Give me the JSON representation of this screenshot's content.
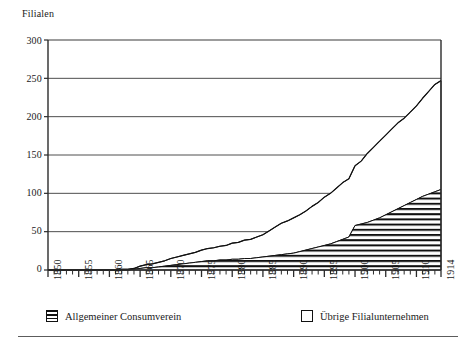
{
  "chart_data": {
    "type": "area",
    "title": "",
    "ylabel": "Filialen",
    "xlabel": "",
    "ylim": [
      0,
      300
    ],
    "xlim": [
      1850,
      1914
    ],
    "yticks": [
      0,
      50,
      100,
      150,
      200,
      250,
      300
    ],
    "xticks": [
      1850,
      1855,
      1860,
      1865,
      1870,
      1875,
      1880,
      1885,
      1890,
      1895,
      1900,
      1905,
      1910,
      1914
    ],
    "xtick_labels": [
      "1850",
      "1855",
      "1860",
      "1865",
      "1870",
      "1875",
      "1880",
      "1885",
      "1890",
      "1895",
      "1900",
      "1905",
      "1910",
      "1914"
    ],
    "ytick_labels": [
      "0",
      "50",
      "100",
      "150",
      "200",
      "250",
      "300"
    ],
    "grid": "horizontal",
    "legend_position": "below",
    "stacked": true,
    "x": [
      1850,
      1851,
      1852,
      1853,
      1854,
      1855,
      1856,
      1857,
      1858,
      1859,
      1860,
      1861,
      1862,
      1863,
      1864,
      1865,
      1866,
      1867,
      1868,
      1869,
      1870,
      1871,
      1872,
      1873,
      1874,
      1875,
      1876,
      1877,
      1878,
      1879,
      1880,
      1881,
      1882,
      1883,
      1884,
      1885,
      1886,
      1887,
      1888,
      1889,
      1890,
      1891,
      1892,
      1893,
      1894,
      1895,
      1896,
      1897,
      1898,
      1899,
      1900,
      1901,
      1902,
      1903,
      1904,
      1905,
      1906,
      1907,
      1908,
      1909,
      1910,
      1911,
      1912,
      1913,
      1914
    ],
    "series": [
      {
        "name": "Allgemeiner Consumverein",
        "fill": "horizontal-hatch",
        "values": [
          0,
          0,
          0,
          0,
          0,
          0,
          0,
          0,
          0,
          0,
          0,
          0,
          0,
          0,
          1,
          2,
          3,
          3,
          4,
          5,
          6,
          7,
          8,
          9,
          10,
          11,
          12,
          12,
          13,
          13,
          14,
          14,
          15,
          15,
          16,
          17,
          18,
          19,
          20,
          21,
          22,
          24,
          26,
          28,
          30,
          32,
          34,
          37,
          40,
          43,
          58,
          60,
          62,
          65,
          68,
          72,
          76,
          80,
          84,
          88,
          92,
          96,
          99,
          102,
          105
        ]
      },
      {
        "name": "Übrige Filialunternehmen",
        "fill": "white",
        "values": [
          0,
          0,
          0,
          0,
          0,
          0,
          0,
          0,
          0,
          0,
          0,
          0,
          1,
          1,
          1,
          3,
          4,
          5,
          6,
          7,
          9,
          10,
          11,
          12,
          13,
          15,
          16,
          17,
          18,
          19,
          21,
          22,
          24,
          25,
          27,
          29,
          33,
          37,
          41,
          43,
          46,
          48,
          51,
          55,
          58,
          63,
          66,
          70,
          74,
          76,
          78,
          82,
          90,
          95,
          100,
          104,
          108,
          112,
          114,
          118,
          122,
          128,
          134,
          140,
          142
        ]
      }
    ],
    "total_line": {
      "name": "Total Filialen",
      "values": [
        0,
        0,
        0,
        0,
        0,
        0,
        0,
        0,
        0,
        0,
        0,
        0,
        1,
        1,
        2,
        5,
        7,
        8,
        10,
        12,
        15,
        17,
        19,
        21,
        23,
        26,
        28,
        29,
        31,
        32,
        35,
        36,
        39,
        40,
        43,
        46,
        51,
        56,
        61,
        64,
        68,
        72,
        77,
        83,
        88,
        95,
        100,
        107,
        114,
        119,
        136,
        142,
        152,
        160,
        168,
        176,
        184,
        192,
        198,
        206,
        214,
        224,
        233,
        242,
        247
      ]
    },
    "annotations": []
  },
  "legend": {
    "items": [
      {
        "label": "Allgemeiner Consumverein",
        "swatch": "hatched-swatch"
      },
      {
        "label": "Übrige Filialunternehmen",
        "swatch": "empty-swatch"
      }
    ]
  }
}
